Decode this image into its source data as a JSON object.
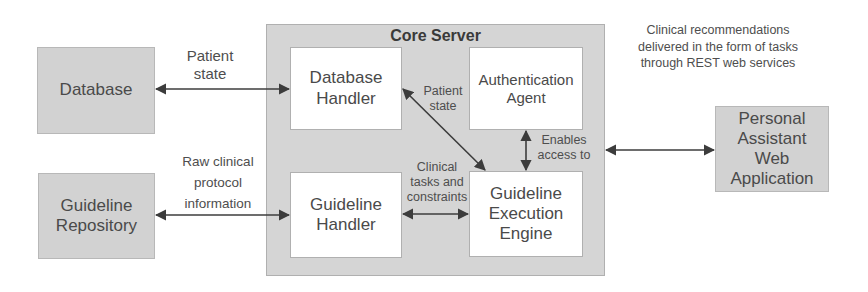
{
  "diagram": {
    "core_server": {
      "title": "Core Server",
      "components": {
        "database_handler": "Database Handler",
        "authentication_agent": "Authentication Agent",
        "guideline_handler": "Guideline Handler",
        "guideline_execution_engine": "Guideline Execution Engine"
      }
    },
    "external": {
      "database": "Database",
      "guideline_repository": "Guideline Repository",
      "personal_assistant": "Personal Assistant Web Application"
    },
    "edges": {
      "db_to_handler": "Patient state",
      "repo_to_handler": "Raw clinical protocol information",
      "handler_to_engine_diag": "Patient state",
      "guideline_handler_to_engine": "Clinical tasks and constraints",
      "auth_to_engine": "Enables access to",
      "core_to_assistant": "Clinical recommendations delivered in the form of tasks through REST web services"
    },
    "colors": {
      "external_box": "#d2d2d2",
      "core_box": "#d5d5d5",
      "inner_box": "#ffffff",
      "arrow": "#3c3c3c",
      "text": "#4a4a4a"
    }
  }
}
